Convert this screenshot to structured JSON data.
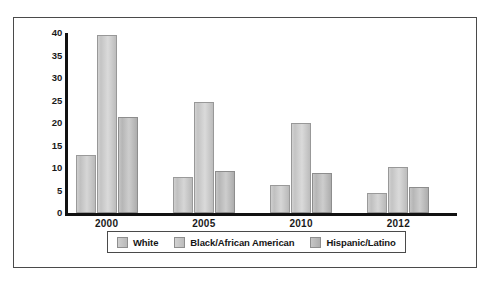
{
  "chart_data": {
    "type": "bar",
    "title": "",
    "subtitle": "",
    "xlabel": "",
    "ylabel": "",
    "categories": [
      "2000",
      "2005",
      "2010",
      "2012"
    ],
    "series": [
      {
        "name": "White",
        "values": [
          13,
          8,
          6.3,
          4.5
        ],
        "color": "#c9c9c9"
      },
      {
        "name": "Black/African American",
        "values": [
          39.5,
          24.7,
          20,
          10.3
        ],
        "color": "#cccccc"
      },
      {
        "name": "Hispanic/Latino",
        "values": [
          21.3,
          9.3,
          8.8,
          5.8
        ],
        "color": "#bbbbbb"
      }
    ],
    "ylim": [
      0,
      40
    ],
    "yticks": [
      0,
      5,
      10,
      15,
      20,
      25,
      30,
      35,
      40
    ],
    "ytick_labels": [
      "0",
      "5",
      "10",
      "15",
      "20",
      "25",
      "30",
      "35",
      "40"
    ],
    "grid": false,
    "legend_position": "bottom",
    "legend_entries": [
      "White",
      "Black/African American",
      "Hispanic/Latino"
    ]
  }
}
